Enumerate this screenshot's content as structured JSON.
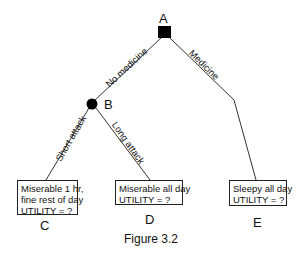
{
  "diagram": {
    "type": "decision-tree",
    "caption": "Figure 3.2",
    "nodes": {
      "A": {
        "label": "A",
        "kind": "decision",
        "shape": "square"
      },
      "B": {
        "label": "B",
        "kind": "chance",
        "shape": "circle"
      },
      "C": {
        "label": "C",
        "kind": "outcome",
        "lines": [
          "Miserable 1 hr,",
          "fine rest of day",
          "UTILITY = ?"
        ]
      },
      "D": {
        "label": "D",
        "kind": "outcome",
        "lines": [
          "Miserable all day",
          "UTILITY = ?"
        ]
      },
      "E": {
        "label": "E",
        "kind": "outcome",
        "lines": [
          "Sleepy all day",
          "UTILITY = ?"
        ]
      }
    },
    "edges": [
      {
        "from": "A",
        "to": "B",
        "label": "No medicine"
      },
      {
        "from": "A",
        "to": "E",
        "label": "Medicine"
      },
      {
        "from": "B",
        "to": "C",
        "label": "Short attack"
      },
      {
        "from": "B",
        "to": "D",
        "label": "Long attack"
      }
    ],
    "colors": {
      "line": "#333333",
      "node_fill": "#000000",
      "background": "#ffffff"
    }
  }
}
